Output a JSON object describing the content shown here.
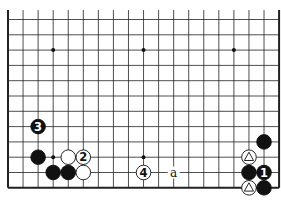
{
  "diagram": {
    "type": "go-board-fragment",
    "columns": 19,
    "rows_visible": 12,
    "edges": [
      "left",
      "right",
      "bottom"
    ],
    "star_points": [
      [
        3,
        2
      ],
      [
        9,
        2
      ],
      [
        15,
        2
      ],
      [
        3,
        9
      ],
      [
        9,
        9
      ]
    ],
    "stones": [
      {
        "color": "black",
        "col": 2,
        "row": 7,
        "label": "3"
      },
      {
        "color": "black",
        "col": 2,
        "row": 9,
        "label": ""
      },
      {
        "color": "white",
        "col": 4,
        "row": 9,
        "label": ""
      },
      {
        "color": "white",
        "col": 5,
        "row": 9,
        "label": "2"
      },
      {
        "color": "black",
        "col": 3,
        "row": 10,
        "label": ""
      },
      {
        "color": "black",
        "col": 4,
        "row": 10,
        "label": ""
      },
      {
        "color": "white",
        "col": 5,
        "row": 10,
        "label": ""
      },
      {
        "color": "white",
        "col": 9,
        "row": 10,
        "label": "4"
      },
      {
        "color": "black",
        "col": 17,
        "row": 8,
        "label": ""
      },
      {
        "color": "white",
        "col": 16,
        "row": 9,
        "label": "triangle"
      },
      {
        "color": "black",
        "col": 16,
        "row": 10,
        "label": ""
      },
      {
        "color": "black",
        "col": 17,
        "row": 10,
        "label": "1"
      },
      {
        "color": "white",
        "col": 16,
        "row": 11,
        "label": "triangle"
      },
      {
        "color": "black",
        "col": 17,
        "row": 11,
        "label": ""
      }
    ],
    "letters": [
      {
        "col": 11,
        "row": 10,
        "text": "a"
      }
    ]
  }
}
